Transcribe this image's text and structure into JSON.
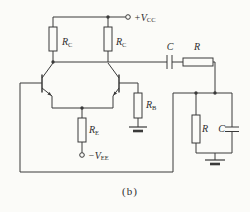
{
  "figure": {
    "type": "circuit-schematic",
    "caption": "(b)",
    "colors": {
      "stroke": "#3a3a3a",
      "background": "#fbfbf8",
      "label": "#2e2e2e"
    },
    "supply": {
      "vcc_main": "+V",
      "vcc_sub": "CC",
      "vee_main": "−V",
      "vee_sub": "EE"
    },
    "components": {
      "rc_left_main": "R",
      "rc_left_sub": "C",
      "rc_right_main": "R",
      "rc_right_sub": "C",
      "coupling_cap": "C",
      "series_resistor": "R",
      "rb_main": "R",
      "rb_sub": "B",
      "re_main": "R",
      "re_sub": "E",
      "load_resistor": "R",
      "load_cap": "C"
    }
  }
}
